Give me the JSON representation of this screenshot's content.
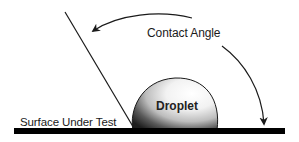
{
  "diagram": {
    "labels": {
      "contact_angle": "Contact Angle",
      "droplet": "Droplet",
      "surface": "Surface Under Test"
    },
    "elements": {
      "surface_bar": {
        "x1": 14,
        "x2": 285,
        "y": 128,
        "thickness": 6,
        "color": "#000000"
      },
      "tangent_line": {
        "x1": 65,
        "y1": 12,
        "x2": 135,
        "y2": 130,
        "color": "#1a1a1a"
      },
      "droplet": {
        "left": 132,
        "right": 218,
        "top": 78,
        "base": 130,
        "highlight_color": "#ffffff",
        "shadow_color": "#2a2a2a"
      },
      "arrow_upper": {
        "from": [
          192,
          18
        ],
        "to": [
          92,
          32
        ],
        "direction": "left"
      },
      "arrow_lower": {
        "from": [
          222,
          46
        ],
        "to": [
          264,
          124
        ],
        "direction": "down"
      }
    },
    "colors": {
      "background": "#ffffff",
      "stroke": "#1a1a1a",
      "surface": "#000000"
    }
  }
}
